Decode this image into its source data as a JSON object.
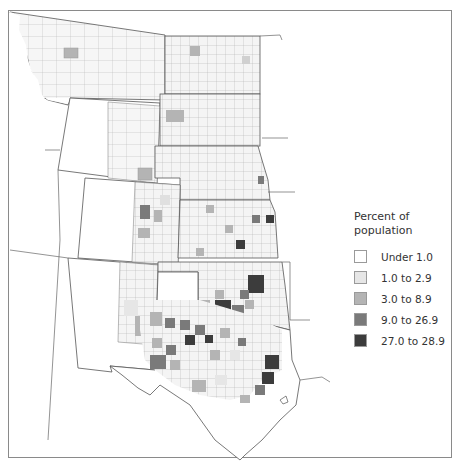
{
  "map": {
    "type": "choropleth",
    "region": "Great Plains counties (Montana/Dakotas to Texas)",
    "states_shown": [
      "Montana",
      "Wyoming",
      "North Dakota",
      "South Dakota",
      "Nebraska",
      "Colorado",
      "Kansas",
      "New Mexico",
      "Oklahoma",
      "Texas"
    ]
  },
  "legend": {
    "title": "Percent of population",
    "items": [
      {
        "label": "Under 1.0",
        "color": "#ffffff"
      },
      {
        "label": "1.0 to 2.9",
        "color": "#e6e6e6"
      },
      {
        "label": "3.0 to 8.9",
        "color": "#b4b4b4"
      },
      {
        "label": "9.0 to 26.9",
        "color": "#7a7a7a"
      },
      {
        "label": "27.0 to 28.9",
        "color": "#3c3c3c"
      }
    ]
  },
  "colors": {
    "border": "#555555",
    "county_border": "#9a9a9a",
    "frame": "#8a8a8a"
  }
}
